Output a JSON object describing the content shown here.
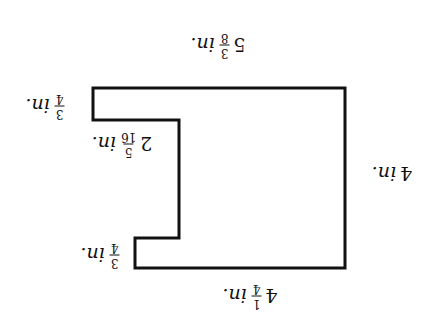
{
  "diagram": {
    "orientation": "rotated 180 degrees",
    "stroke_color": "#111111",
    "shape": {
      "type": "rectilinear polygon",
      "points_upright": [
        [
          347,
          240
        ],
        [
          95,
          240
        ],
        [
          95,
          60
        ],
        [
          305,
          60
        ],
        [
          305,
          90
        ],
        [
          261,
          90
        ],
        [
          261,
          208
        ],
        [
          347,
          208
        ]
      ]
    },
    "labels": [
      {
        "id": "top",
        "whole": "5",
        "num": "3",
        "den": "8",
        "unit": "in.",
        "x_upright": 222,
        "y_upright": 283
      },
      {
        "id": "notch-top",
        "whole": "",
        "num": "3",
        "den": "4",
        "unit": "in.",
        "x_upright": 395,
        "y_upright": 222
      },
      {
        "id": "inner-side",
        "whole": "2",
        "num": "5",
        "den": "16",
        "unit": "in.",
        "x_upright": 318,
        "y_upright": 184
      },
      {
        "id": "outer-side",
        "whole": "4",
        "num": "",
        "den": "",
        "unit": "in.",
        "x_upright": 48,
        "y_upright": 154
      },
      {
        "id": "notch-bottom",
        "whole": "",
        "num": "3",
        "den": "4",
        "unit": "in.",
        "x_upright": 340,
        "y_upright": 73
      },
      {
        "id": "bottom",
        "whole": "4",
        "num": "1",
        "den": "4",
        "unit": "in.",
        "x_upright": 190,
        "y_upright": 32
      }
    ]
  }
}
